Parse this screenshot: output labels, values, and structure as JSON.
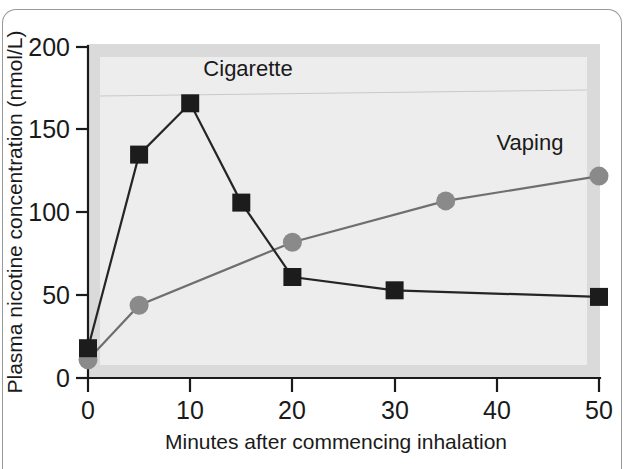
{
  "chart_data": {
    "type": "line",
    "title": "",
    "xlabel": "Minutes after commencing inhalation",
    "ylabel": "Plasma nicotine concentration (nmol/L)",
    "xlim": [
      0,
      50
    ],
    "ylim": [
      0,
      200
    ],
    "xticks": [
      0,
      10,
      20,
      30,
      40,
      50
    ],
    "xtick_labels": [
      "0",
      "10",
      "20",
      "30",
      "40",
      "50"
    ],
    "yticks": [
      0,
      50,
      100,
      150,
      200
    ],
    "ytick_labels": [
      "0",
      "50",
      "100",
      "150",
      "200"
    ],
    "grid": false,
    "legend_position": "inline-annotations",
    "series": [
      {
        "name": "Cigarette",
        "marker": "square",
        "color": "#1c1c1c",
        "x": [
          0,
          5,
          10,
          15,
          20,
          30,
          50
        ],
        "values": [
          18,
          135,
          166,
          106,
          61,
          53,
          49
        ]
      },
      {
        "name": "Vaping",
        "marker": "circle",
        "color": "#8a8a8a",
        "x": [
          0,
          5,
          20,
          35,
          50
        ],
        "values": [
          11,
          44,
          82,
          107,
          122
        ]
      }
    ],
    "annotations": [
      {
        "text": "Cigarette",
        "x": 15,
        "y": 186
      },
      {
        "text": "Vaping",
        "x": 41,
        "y": 144
      }
    ]
  },
  "axis": {
    "y_title": "Plasma nicotine concentration (nmol/L)",
    "x_title": "Minutes after commencing inhalation",
    "y_labels": [
      "200",
      "150",
      "100",
      "50",
      "0"
    ],
    "x_labels": [
      "0",
      "10",
      "20",
      "30",
      "40",
      "50"
    ]
  },
  "labels": {
    "cigarette": "Cigarette",
    "vaping": "Vaping"
  }
}
